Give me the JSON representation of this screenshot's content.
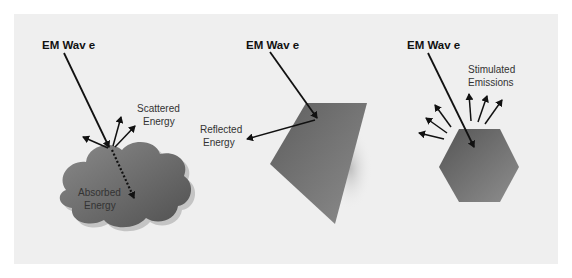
{
  "diagram": {
    "panels": [
      {
        "id": "absorption-scattering",
        "incident_label": "EM Wav e",
        "labels": [
          "Scattered",
          "Energy",
          "Absorbed",
          "Energy"
        ],
        "object": "cloud"
      },
      {
        "id": "reflection",
        "incident_label": "EM Wav e",
        "labels": [
          "Reflected",
          "Energy"
        ],
        "object": "plane"
      },
      {
        "id": "emission",
        "incident_label": "EM Wav e",
        "labels": [
          "Stimulated",
          "Emissions"
        ],
        "object": "hexagon"
      }
    ],
    "colors": {
      "background": "#efefef",
      "object_dark": "#5a5a5a",
      "object_light": "#9a9a9a",
      "arrow": "#111111"
    }
  }
}
